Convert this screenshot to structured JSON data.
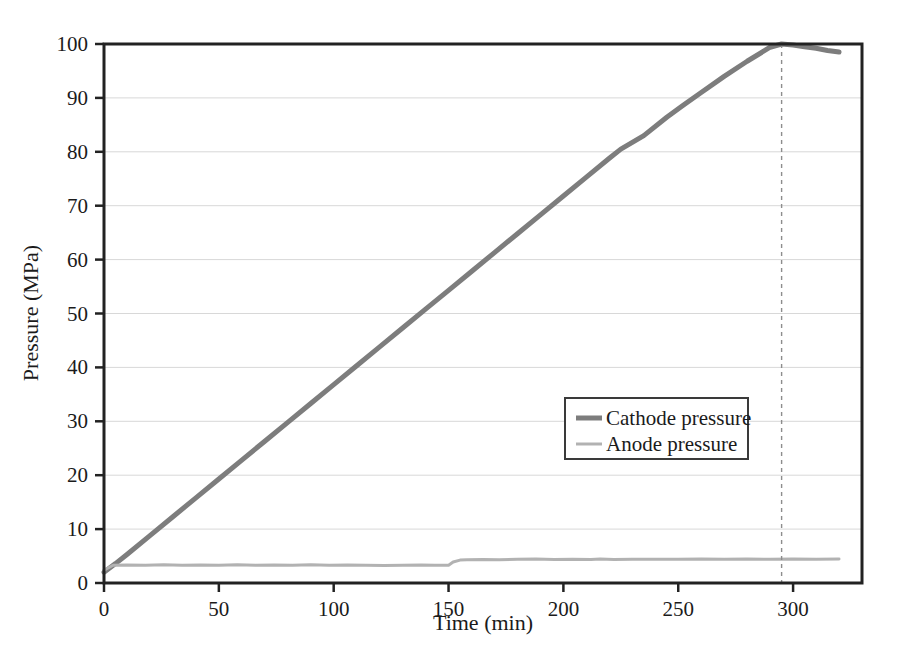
{
  "chart_data": {
    "type": "line",
    "title": "",
    "xlabel": "Time (min)",
    "ylabel": "Pressure (MPa)",
    "xlim": [
      0,
      330
    ],
    "ylim": [
      0,
      100
    ],
    "grid": "horizontal",
    "legend_position": "center-right",
    "xticks": [
      0,
      50,
      100,
      150,
      200,
      250,
      300
    ],
    "xtick_labels": [
      "0",
      "50",
      "100",
      "150",
      "200",
      "250",
      "300"
    ],
    "yticks": [
      0,
      10,
      20,
      30,
      40,
      50,
      60,
      70,
      80,
      90,
      100
    ],
    "ytick_labels": [
      "0",
      "10",
      "20",
      "30",
      "40",
      "50",
      "60",
      "70",
      "80",
      "90",
      "100"
    ],
    "annotations": [
      {
        "name": "peak-marker",
        "type": "vertical-dashed-line",
        "x": 295,
        "label": ""
      }
    ],
    "series": [
      {
        "name": "Cathode pressure",
        "color": "#7d7d7d",
        "width": 5,
        "x": [
          0,
          5,
          10,
          20,
          30,
          40,
          50,
          60,
          70,
          80,
          90,
          100,
          110,
          120,
          130,
          140,
          150,
          160,
          170,
          180,
          190,
          200,
          210,
          220,
          225,
          235,
          245,
          252,
          260,
          270,
          280,
          290,
          295,
          300,
          305,
          310,
          315,
          320
        ],
        "y": [
          2.0,
          3.6,
          5.3,
          8.8,
          12.3,
          15.8,
          19.3,
          22.8,
          26.3,
          29.8,
          33.3,
          36.8,
          40.3,
          43.8,
          47.3,
          50.8,
          54.3,
          57.8,
          61.3,
          64.8,
          68.3,
          71.8,
          75.3,
          78.8,
          80.5,
          83.0,
          86.4,
          88.6,
          91.0,
          94.0,
          96.8,
          99.4,
          100.0,
          99.8,
          99.5,
          99.2,
          98.8,
          98.5
        ]
      },
      {
        "name": "Anode pressure",
        "color": "#b2b2b2",
        "width": 3,
        "x": [
          0,
          4,
          10,
          18,
          26,
          34,
          42,
          50,
          58,
          66,
          74,
          82,
          90,
          98,
          106,
          114,
          122,
          130,
          138,
          144,
          150,
          152,
          155,
          158,
          165,
          172,
          180,
          188,
          196,
          204,
          212,
          216,
          222,
          230,
          240,
          250,
          260,
          270,
          280,
          290,
          300,
          310,
          320
        ],
        "y": [
          2.4,
          3.3,
          3.35,
          3.3,
          3.4,
          3.3,
          3.35,
          3.3,
          3.4,
          3.3,
          3.35,
          3.3,
          3.4,
          3.3,
          3.35,
          3.3,
          3.25,
          3.3,
          3.35,
          3.3,
          3.3,
          3.9,
          4.25,
          4.3,
          4.35,
          4.3,
          4.4,
          4.45,
          4.35,
          4.4,
          4.35,
          4.45,
          4.35,
          4.4,
          4.4,
          4.4,
          4.45,
          4.4,
          4.45,
          4.4,
          4.45,
          4.4,
          4.45
        ]
      }
    ]
  },
  "legend": {
    "entries": [
      {
        "label": "Cathode pressure",
        "color": "#7d7d7d"
      },
      {
        "label": "Anode pressure",
        "color": "#b2b2b2"
      }
    ]
  },
  "axes": {
    "x_title": "Time (min)",
    "y_title": "Pressure (MPa)"
  }
}
